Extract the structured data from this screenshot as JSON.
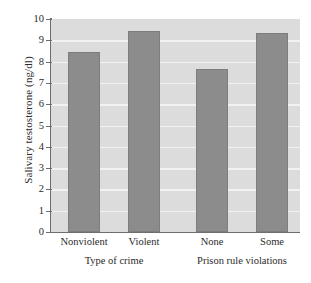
{
  "chart_data": {
    "type": "bar",
    "title": "",
    "xlabel": "",
    "ylabel": "Salivary testosterone (ng/dl)",
    "ylim": [
      0,
      10
    ],
    "ytick_labels": [
      "0",
      "1",
      "2",
      "3",
      "4",
      "5",
      "6",
      "7",
      "8",
      "9",
      "10"
    ],
    "ytick_values": [
      0,
      1,
      2,
      3,
      4,
      5,
      6,
      7,
      8,
      9,
      10
    ],
    "grid": "horizontal",
    "legend": "none",
    "categories": [
      "Nonviolent",
      "Violent",
      "None",
      "Some"
    ],
    "values": [
      8.45,
      9.45,
      7.65,
      9.35
    ],
    "groups": [
      {
        "label": "Type of crime",
        "categories": [
          "Nonviolent",
          "Violent"
        ]
      },
      {
        "label": "Prison rule violations",
        "categories": [
          "None",
          "Some"
        ]
      }
    ],
    "colors": {
      "bar_fill": "#8c8c8c",
      "bar_edge": "#7d7d7d",
      "plot_background": "#dcdcdc",
      "gridline": "#f2f2f2",
      "axis": "#6e6e6e",
      "text": "#2b2b2b"
    }
  }
}
